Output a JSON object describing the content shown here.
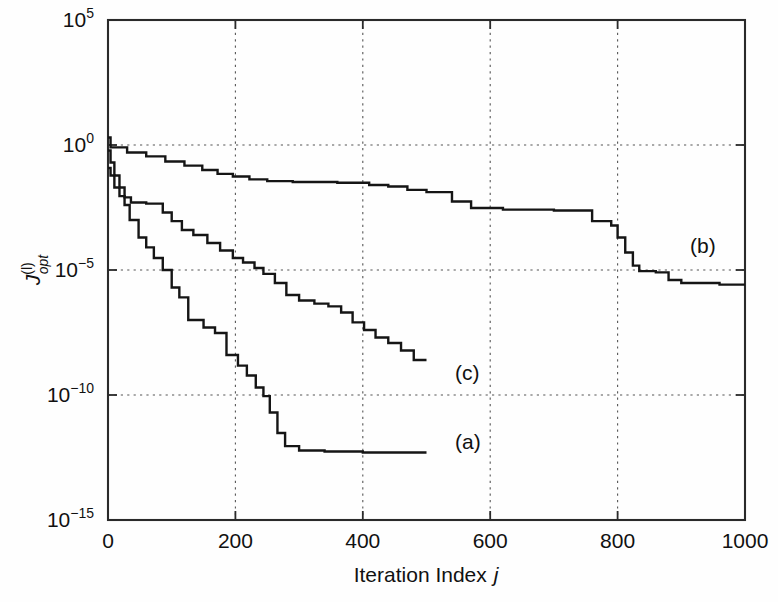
{
  "figure": {
    "background": "#fefefe",
    "ink": "#151515",
    "type": "semilog-line-chart"
  },
  "axes": {
    "xlabel_prefix": "Iteration Index ",
    "xlabel_symbol": "j",
    "ylabel_base": "J",
    "ylabel_sup": "(l)",
    "ylabel_sub": "opt",
    "x_ticks": [
      "0",
      "200",
      "400",
      "600",
      "800",
      "1000"
    ],
    "y_ticks": [
      "10",
      "10",
      "10",
      "10",
      "10"
    ],
    "y_tick_exponents": [
      "5",
      "0",
      "−5",
      "−10",
      "−15"
    ]
  },
  "curve_labels": [
    {
      "name": "curve-label-a",
      "text": "(a)",
      "x": 455,
      "y": 449
    },
    {
      "name": "curve-label-b",
      "text": "(b)",
      "x": 690,
      "y": 253
    },
    {
      "name": "curve-label-c",
      "text": "(c)",
      "x": 455,
      "y": 380
    }
  ],
  "chart_data": {
    "type": "line",
    "title": "",
    "xlabel": "Iteration Index j",
    "ylabel": "J^(l)_opt",
    "xlim": [
      0,
      1000
    ],
    "ylim": [
      1e-15,
      100000.0
    ],
    "yscale": "log",
    "xticks": [
      0,
      200,
      400,
      600,
      800,
      1000
    ],
    "yticks": [
      100000.0,
      1.0,
      1e-05,
      1e-10,
      1e-15
    ],
    "grid": "dotted-horizontal-and-vertical-at-ticks",
    "legend": "inline annotations (a), (b), (c)",
    "series": [
      {
        "name": "(a)",
        "style": "staircase monotone decreasing",
        "points": [
          [
            0,
            0.12
          ],
          [
            4,
            0.12
          ],
          [
            4,
            0.06
          ],
          [
            10,
            0.06
          ],
          [
            10,
            0.02
          ],
          [
            18,
            0.02
          ],
          [
            18,
            0.009
          ],
          [
            26,
            0.009
          ],
          [
            26,
            0.004
          ],
          [
            34,
            0.004
          ],
          [
            34,
            0.001
          ],
          [
            48,
            0.001
          ],
          [
            48,
            0.0002
          ],
          [
            60,
            0.0002
          ],
          [
            60,
            8e-05
          ],
          [
            72,
            8e-05
          ],
          [
            72,
            3e-05
          ],
          [
            86,
            3e-05
          ],
          [
            86,
            1e-05
          ],
          [
            100,
            1e-05
          ],
          [
            100,
            2e-06
          ],
          [
            112,
            2e-06
          ],
          [
            112,
            8e-07
          ],
          [
            126,
            8e-07
          ],
          [
            126,
            1e-07
          ],
          [
            150,
            1e-07
          ],
          [
            150,
            5e-08
          ],
          [
            168,
            5e-08
          ],
          [
            168,
            3e-08
          ],
          [
            186,
            3e-08
          ],
          [
            186,
            4e-09
          ],
          [
            204,
            4e-09
          ],
          [
            204,
            1.5e-09
          ],
          [
            218,
            1.5e-09
          ],
          [
            218,
            6e-10
          ],
          [
            232,
            6e-10
          ],
          [
            232,
            2e-10
          ],
          [
            244,
            2e-10
          ],
          [
            244,
            9e-11
          ],
          [
            254,
            9e-11
          ],
          [
            254,
            2e-11
          ],
          [
            266,
            2e-11
          ],
          [
            266,
            3e-12
          ],
          [
            278,
            3e-12
          ],
          [
            278,
            9e-13
          ],
          [
            300,
            9e-13
          ],
          [
            300,
            6e-13
          ],
          [
            340,
            6e-13
          ],
          [
            340,
            5.5e-13
          ],
          [
            400,
            5.5e-13
          ],
          [
            400,
            5e-13
          ],
          [
            500,
            5e-13
          ]
        ]
      },
      {
        "name": "(b)",
        "style": "staircase monotone decreasing, slowest",
        "points": [
          [
            0,
            2.0
          ],
          [
            4,
            2.0
          ],
          [
            4,
            0.8
          ],
          [
            30,
            0.8
          ],
          [
            30,
            0.5
          ],
          [
            60,
            0.5
          ],
          [
            60,
            0.35
          ],
          [
            90,
            0.35
          ],
          [
            90,
            0.22
          ],
          [
            120,
            0.22
          ],
          [
            120,
            0.15
          ],
          [
            148,
            0.15
          ],
          [
            148,
            0.1
          ],
          [
            172,
            0.1
          ],
          [
            172,
            0.07
          ],
          [
            196,
            0.07
          ],
          [
            196,
            0.055
          ],
          [
            222,
            0.055
          ],
          [
            222,
            0.042
          ],
          [
            250,
            0.042
          ],
          [
            250,
            0.036
          ],
          [
            290,
            0.036
          ],
          [
            290,
            0.033
          ],
          [
            360,
            0.033
          ],
          [
            360,
            0.031
          ],
          [
            410,
            0.031
          ],
          [
            410,
            0.025
          ],
          [
            440,
            0.025
          ],
          [
            440,
            0.022
          ],
          [
            470,
            0.022
          ],
          [
            470,
            0.016
          ],
          [
            500,
            0.016
          ],
          [
            500,
            0.013
          ],
          [
            540,
            0.013
          ],
          [
            540,
            0.0055
          ],
          [
            570,
            0.0055
          ],
          [
            570,
            0.003
          ],
          [
            620,
            0.003
          ],
          [
            620,
            0.0026
          ],
          [
            700,
            0.0026
          ],
          [
            700,
            0.0024
          ],
          [
            760,
            0.0024
          ],
          [
            760,
            0.0009
          ],
          [
            790,
            0.0009
          ],
          [
            790,
            0.0006
          ],
          [
            800,
            0.0006
          ],
          [
            800,
            0.0002
          ],
          [
            812,
            0.0002
          ],
          [
            812,
            5e-05
          ],
          [
            824,
            5e-05
          ],
          [
            824,
            1.5e-05
          ],
          [
            834,
            1.5e-05
          ],
          [
            834,
            9e-06
          ],
          [
            860,
            9e-06
          ],
          [
            860,
            8e-06
          ],
          [
            880,
            8e-06
          ],
          [
            880,
            4e-06
          ],
          [
            900,
            4e-06
          ],
          [
            900,
            3e-06
          ],
          [
            960,
            3e-06
          ],
          [
            960,
            2.6e-06
          ],
          [
            1000,
            2.6e-06
          ]
        ]
      },
      {
        "name": "(c)",
        "style": "staircase monotone decreasing, intermediate",
        "points": [
          [
            0,
            0.6
          ],
          [
            4,
            0.6
          ],
          [
            4,
            0.2
          ],
          [
            10,
            0.2
          ],
          [
            10,
            0.06
          ],
          [
            18,
            0.06
          ],
          [
            18,
            0.02
          ],
          [
            26,
            0.02
          ],
          [
            26,
            0.008
          ],
          [
            36,
            0.008
          ],
          [
            36,
            0.005
          ],
          [
            60,
            0.005
          ],
          [
            60,
            0.0045
          ],
          [
            86,
            0.0045
          ],
          [
            86,
            0.002
          ],
          [
            100,
            0.002
          ],
          [
            100,
            0.0009
          ],
          [
            116,
            0.0009
          ],
          [
            116,
            0.0004
          ],
          [
            134,
            0.0004
          ],
          [
            134,
            0.00025
          ],
          [
            156,
            0.00025
          ],
          [
            156,
            0.00012
          ],
          [
            176,
            0.00012
          ],
          [
            176,
            6e-05
          ],
          [
            196,
            6e-05
          ],
          [
            196,
            3e-05
          ],
          [
            212,
            3e-05
          ],
          [
            212,
            2e-05
          ],
          [
            230,
            2e-05
          ],
          [
            230,
            1.2e-05
          ],
          [
            244,
            1.2e-05
          ],
          [
            244,
            7e-06
          ],
          [
            262,
            7e-06
          ],
          [
            262,
            3e-06
          ],
          [
            280,
            3e-06
          ],
          [
            280,
            1e-06
          ],
          [
            300,
            1e-06
          ],
          [
            300,
            6e-07
          ],
          [
            324,
            6e-07
          ],
          [
            324,
            4.5e-07
          ],
          [
            346,
            4.5e-07
          ],
          [
            346,
            3.5e-07
          ],
          [
            366,
            3.5e-07
          ],
          [
            366,
            2e-07
          ],
          [
            384,
            2e-07
          ],
          [
            384,
            8e-08
          ],
          [
            402,
            8e-08
          ],
          [
            402,
            4e-08
          ],
          [
            420,
            4e-08
          ],
          [
            420,
            2e-08
          ],
          [
            440,
            2e-08
          ],
          [
            440,
            1.2e-08
          ],
          [
            460,
            1.2e-08
          ],
          [
            460,
            6e-09
          ],
          [
            480,
            6e-09
          ],
          [
            480,
            2.5e-09
          ],
          [
            500,
            2.5e-09
          ]
        ]
      }
    ]
  }
}
